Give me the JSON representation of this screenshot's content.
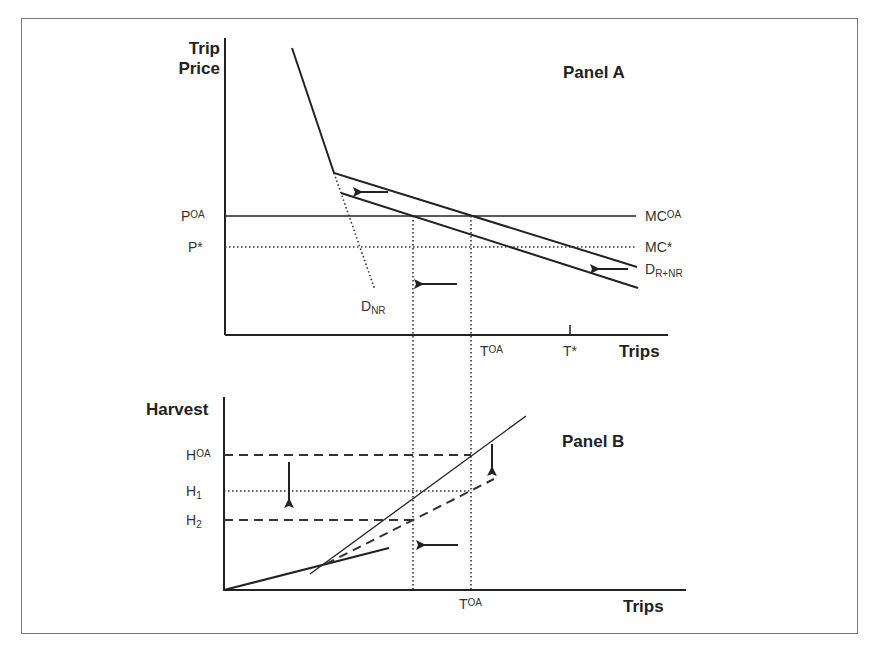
{
  "panel_a": {
    "title": "Panel A",
    "y_axis_label_line1": "Trip",
    "y_axis_label_line2": "Price",
    "x_axis_label": "Trips",
    "price_labels": [
      {
        "base": "P",
        "sup": "OA"
      },
      {
        "base": "P*",
        "sup": ""
      }
    ],
    "cost_labels": [
      {
        "base": "MC",
        "sup": "OA"
      },
      {
        "base": "MC*",
        "sup": ""
      }
    ],
    "demand_labels": {
      "nr": {
        "base": "D",
        "sub": "NR"
      },
      "r_nr": {
        "base": "D",
        "sub": "R+NR"
      }
    },
    "trip_ticks": [
      {
        "base": "T",
        "sup": "OA"
      },
      {
        "base": "T*",
        "sup": ""
      }
    ]
  },
  "panel_b": {
    "title": "Panel B",
    "y_axis_label": "Harvest",
    "x_axis_label": "Trips",
    "harvest_labels": [
      {
        "base": "H",
        "sup": "OA"
      },
      {
        "base": "H",
        "sub": "1"
      },
      {
        "base": "H",
        "sub": "2"
      }
    ],
    "trip_tick": {
      "base": "T",
      "sup": "OA"
    }
  },
  "colors": {
    "line": "#222222",
    "text": "#333333",
    "border": "#777777"
  }
}
